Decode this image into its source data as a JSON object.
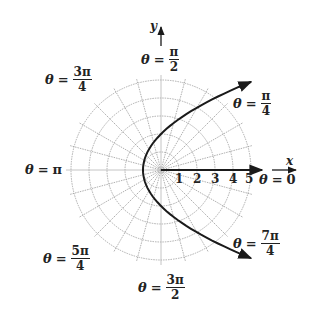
{
  "diagram": {
    "type": "polar-graph",
    "curve": "parabola r = 2/(1 - cos θ)",
    "axes": {
      "x_label": "x",
      "y_label": "y"
    },
    "radial_ticks": [
      "1",
      "2",
      "3",
      "4",
      "5"
    ],
    "angle_labels": [
      {
        "id": "theta-0",
        "lhs": "θ",
        "eq": "=",
        "value": "0"
      },
      {
        "id": "theta-pi-4",
        "lhs": "θ",
        "eq": "=",
        "num": "π",
        "den": "4"
      },
      {
        "id": "theta-pi-2",
        "lhs": "θ",
        "eq": "=",
        "num": "π",
        "den": "2"
      },
      {
        "id": "theta-3pi-4",
        "lhs": "θ",
        "eq": "=",
        "num": "3π",
        "den": "4"
      },
      {
        "id": "theta-pi",
        "lhs": "θ",
        "eq": "=",
        "value": "π"
      },
      {
        "id": "theta-5pi-4",
        "lhs": "θ",
        "eq": "=",
        "num": "5π",
        "den": "4"
      },
      {
        "id": "theta-3pi-2",
        "lhs": "θ",
        "eq": "=",
        "num": "3π",
        "den": "2"
      },
      {
        "id": "theta-7pi-4",
        "lhs": "θ",
        "eq": "=",
        "num": "7π",
        "den": "4"
      }
    ],
    "colors": {
      "grid": "#9a9a9a",
      "curve": "#1a1a1a",
      "text": "#222222"
    }
  }
}
